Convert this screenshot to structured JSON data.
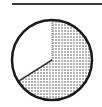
{
  "chart_data": {
    "type": "pie",
    "title": "",
    "slices": [
      {
        "label": "",
        "value": 66,
        "fill": "dotted",
        "color": "#9a9a9a"
      },
      {
        "label": "",
        "value": 34,
        "fill": "solid",
        "color": "#ffffff"
      }
    ],
    "start_angle_deg": 0,
    "direction": "clockwise",
    "outline_color": "#1a1a1a",
    "legend": null
  }
}
